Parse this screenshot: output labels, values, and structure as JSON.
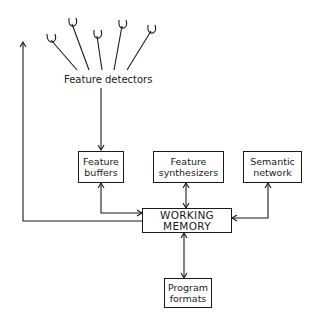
{
  "diagram": {
    "type": "block-diagram",
    "detectors_label": "Feature detectors",
    "nodes": {
      "feature_buffers": {
        "line1": "Feature",
        "line2": "buffers"
      },
      "feature_synthesizers": {
        "line1": "Feature",
        "line2": "synthesizers"
      },
      "semantic_network": {
        "line1": "Semantic",
        "line2": "network"
      },
      "working_memory": {
        "line1": "WORKING",
        "line2": "MEMORY"
      },
      "program_formats": {
        "line1": "Program",
        "line2": "formats"
      }
    },
    "edges": [
      {
        "from": "Feature detectors",
        "to": "Feature buffers",
        "direction": "one-way"
      },
      {
        "from": "Feature buffers",
        "to": "WORKING MEMORY",
        "direction": "two-way"
      },
      {
        "from": "Feature synthesizers",
        "to": "WORKING MEMORY",
        "direction": "two-way"
      },
      {
        "from": "Semantic network",
        "to": "WORKING MEMORY",
        "direction": "two-way"
      },
      {
        "from": "WORKING MEMORY",
        "to": "Program formats",
        "direction": "two-way"
      },
      {
        "from": "WORKING MEMORY",
        "to": "Feature detectors (feedback)",
        "direction": "one-way"
      }
    ],
    "detector_count": 5
  }
}
